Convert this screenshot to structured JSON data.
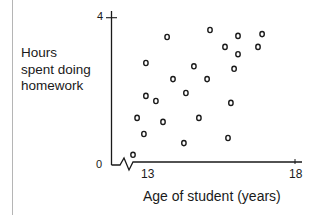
{
  "chart_data": {
    "type": "scatter",
    "title": "",
    "xlabel": "Age of student (years)",
    "ylabel": "Hours spent doing homework",
    "ylabel_lines": [
      "Hours",
      "spent doing",
      "homework"
    ],
    "xlim": [
      12.5,
      18.2
    ],
    "ylim": [
      0,
      4
    ],
    "x_ticks": [
      13,
      18
    ],
    "y_ticks": [
      0,
      4
    ],
    "x_tick_labels": [
      "13",
      "18"
    ],
    "y_tick_labels": [
      "0",
      "4"
    ],
    "axis_break": "zigzag on x-axis near origin",
    "grid": false,
    "legend": null,
    "points": [
      {
        "x": 13.65,
        "y": 3.47
      },
      {
        "x": 15.11,
        "y": 3.66
      },
      {
        "x": 16.06,
        "y": 3.5
      },
      {
        "x": 16.88,
        "y": 3.55
      },
      {
        "x": 15.62,
        "y": 3.2
      },
      {
        "x": 16.06,
        "y": 3.0
      },
      {
        "x": 16.74,
        "y": 3.2
      },
      {
        "x": 12.93,
        "y": 2.76
      },
      {
        "x": 14.56,
        "y": 2.67
      },
      {
        "x": 15.93,
        "y": 2.6
      },
      {
        "x": 13.85,
        "y": 2.32
      },
      {
        "x": 15.01,
        "y": 2.32
      },
      {
        "x": 12.93,
        "y": 1.86
      },
      {
        "x": 13.27,
        "y": 1.72
      },
      {
        "x": 14.29,
        "y": 1.94
      },
      {
        "x": 15.82,
        "y": 1.67
      },
      {
        "x": 12.63,
        "y": 1.26
      },
      {
        "x": 13.51,
        "y": 1.15
      },
      {
        "x": 14.73,
        "y": 1.26
      },
      {
        "x": 12.86,
        "y": 0.82
      },
      {
        "x": 14.22,
        "y": 0.57
      },
      {
        "x": 15.72,
        "y": 0.71
      },
      {
        "x": 12.49,
        "y": 0.25
      }
    ]
  },
  "labels": {
    "ylabel_lines": [
      "Hours",
      "spent doing",
      "homework"
    ],
    "xlabel": "Age of student (years)",
    "y_tick_top": "4",
    "y_tick_bottom": "0",
    "x_tick_left": "13",
    "x_tick_right": "18"
  },
  "colors": {
    "ink": "#1a1a1a",
    "frame": "#b5b5b5",
    "background": "#ffffff"
  }
}
